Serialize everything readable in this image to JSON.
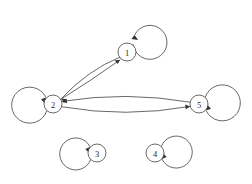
{
  "diagram": {
    "background_color": "#ffffff",
    "stroke_color": "#4d4d4d",
    "arrow_color": "#333333",
    "label_color": "#2b2b2b",
    "canvas": {
      "width": 252,
      "height": 184
    },
    "nodes": [
      {
        "id": "1",
        "label": "1",
        "cx": 127,
        "cy": 52,
        "r": 9,
        "self_loop": {
          "present": true,
          "direction": "up",
          "loop_cx": 128,
          "loop_cy": 27,
          "loop_r": 17,
          "arrow_entry": "upper-right"
        }
      },
      {
        "id": "2",
        "label": "2",
        "cx": 53,
        "cy": 104,
        "r": 9,
        "self_loop": {
          "present": true,
          "direction": "left",
          "loop_cx": 33,
          "loop_cy": 105,
          "loop_r": 18,
          "arrow_entry": "upper-left"
        }
      },
      {
        "id": "3",
        "label": "3",
        "cx": 97,
        "cy": 153,
        "r": 9,
        "self_loop": {
          "present": true,
          "direction": "left",
          "loop_cx": 79,
          "loop_cy": 154,
          "loop_r": 16,
          "arrow_entry": "upper-left"
        }
      },
      {
        "id": "4",
        "label": "4",
        "cx": 155,
        "cy": 153,
        "r": 9,
        "self_loop": {
          "present": true,
          "direction": "right",
          "loop_cx": 173,
          "loop_cy": 154,
          "loop_r": 16,
          "arrow_entry": "lower-right"
        }
      },
      {
        "id": "5",
        "label": "5",
        "cx": 199,
        "cy": 104,
        "r": 9,
        "self_loop": {
          "present": true,
          "direction": "right",
          "loop_cx": 219,
          "loop_cy": 105,
          "loop_r": 18,
          "arrow_entry": "lower-right"
        }
      }
    ],
    "edges": [
      {
        "id": "e-1-2",
        "from": "1",
        "to": "2",
        "style": "curved",
        "arrow_at": "2"
      },
      {
        "id": "e-2-1",
        "from": "2",
        "to": "1",
        "style": "curved",
        "arrow_at": "1"
      },
      {
        "id": "e-5-2",
        "from": "5",
        "to": "2",
        "style": "curved",
        "arrow_at": "2"
      },
      {
        "id": "e-2-5",
        "from": "2",
        "to": "5",
        "style": "curved",
        "arrow_at": "5"
      }
    ],
    "isolated_nodes": [
      "3",
      "4"
    ]
  }
}
